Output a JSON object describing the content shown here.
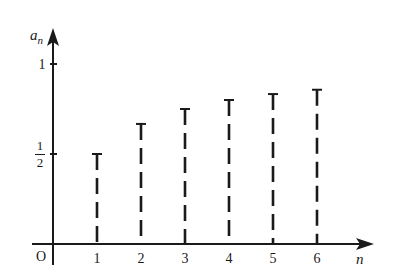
{
  "chart_data": {
    "type": "bar",
    "style": "dashed vertical segments with T-caps",
    "title": "",
    "xlabel": "n",
    "ylabel": "a_n",
    "origin_label": "O",
    "categories": [
      "1",
      "2",
      "3",
      "4",
      "5",
      "6"
    ],
    "x": [
      1,
      2,
      3,
      4,
      5,
      6
    ],
    "values": [
      0.5,
      0.667,
      0.75,
      0.8,
      0.833,
      0.857
    ],
    "value_labels_formula": "a_n = n/(n+1)",
    "y_ticks": [
      {
        "value": 0.5,
        "label_num": "1",
        "label_den": "2"
      },
      {
        "value": 1,
        "label": "1"
      }
    ],
    "ylim": [
      0,
      1.17
    ],
    "xlim": [
      0,
      7.1
    ],
    "grid": false,
    "legend": null
  },
  "colors": {
    "ink": "#1a1a1a",
    "background": "#ffffff"
  }
}
